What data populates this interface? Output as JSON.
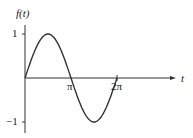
{
  "chart_data": {
    "type": "line",
    "title": "",
    "xlabel": "t",
    "ylabel": "f(t)",
    "function": "sin(t)",
    "x_ticks": [
      {
        "value": 3.14159,
        "label": "π"
      },
      {
        "value": 6.28318,
        "label": "2π"
      }
    ],
    "y_ticks": [
      {
        "value": 1,
        "label": "1"
      },
      {
        "value": -1,
        "label": "−1"
      }
    ],
    "x": [
      0,
      0.785,
      1.571,
      2.356,
      3.142,
      3.927,
      4.712,
      5.498,
      6.283
    ],
    "series": [
      {
        "name": "f(t)",
        "values": [
          0,
          0.707,
          1,
          0.707,
          0,
          -0.707,
          -1,
          -0.707,
          0
        ]
      }
    ],
    "xlim": [
      0,
      6.283
    ],
    "ylim": [
      -1.2,
      1.2
    ],
    "grid": false,
    "legend": "none"
  },
  "labels": {
    "ylabel": "f(t)",
    "xlabel": "t",
    "y_pos": "1",
    "y_neg": "−1",
    "x_pi": "π",
    "x_2pi": "2π"
  }
}
